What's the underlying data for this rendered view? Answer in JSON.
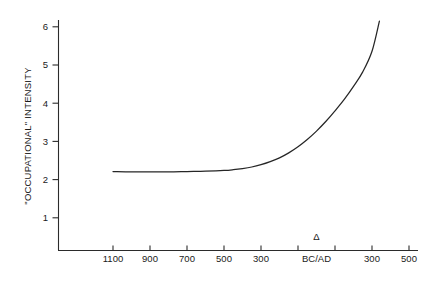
{
  "chart_data": {
    "type": "line",
    "title": "",
    "xlabel": "BC/AD",
    "ylabel": "\"OCCUPATIONAL\" INTENSITY",
    "xtick_labels": [
      "1100",
      "900",
      "700",
      "500",
      "300",
      "Δ",
      "300",
      "500"
    ],
    "xtick_values": [
      1100,
      900,
      700,
      500,
      300,
      0,
      -300,
      -500
    ],
    "origin_symbol": "Δ",
    "origin_label": "BC/AD",
    "ytick_labels": [
      "1",
      "2",
      "3",
      "4",
      "5",
      "6"
    ],
    "ylim": [
      0,
      6.4
    ],
    "grid": false,
    "legend": false,
    "series": [
      {
        "name": "\"Occupational\" intensity",
        "x": [
          1100,
          1000,
          900,
          800,
          700,
          600,
          500,
          450,
          400,
          350,
          300,
          250,
          200,
          150,
          100,
          50,
          0,
          -50,
          -100,
          -150,
          -200,
          -250,
          -300,
          -340
        ],
        "y": [
          2.21,
          2.2,
          2.2,
          2.2,
          2.21,
          2.22,
          2.24,
          2.26,
          2.29,
          2.33,
          2.39,
          2.47,
          2.57,
          2.7,
          2.86,
          3.05,
          3.27,
          3.52,
          3.8,
          4.1,
          4.44,
          4.82,
          5.36,
          6.15
        ]
      }
    ]
  },
  "colors": {
    "axis": "#2b2b2b",
    "curve": "#262626",
    "background": "#ffffff",
    "text": "#1a1a1a"
  }
}
